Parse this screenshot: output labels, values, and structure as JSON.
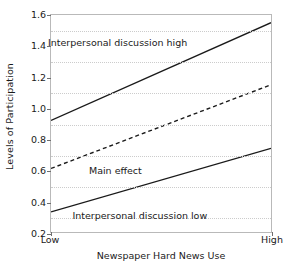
{
  "chart_data": {
    "type": "line",
    "title": "",
    "xlabel": "Newspaper Hard News Use",
    "ylabel": "Levels of Participation",
    "x": [
      0,
      1
    ],
    "xtick_labels": [
      "Low",
      "High"
    ],
    "ylim": [
      0.2,
      1.6
    ],
    "yticks": [
      0.2,
      0.4,
      0.6,
      0.8,
      1.0,
      1.2,
      1.4,
      1.6
    ],
    "ytick_labels": [
      "0.2",
      "0.4",
      "0.6",
      "0.8",
      "1.0",
      "1.2",
      "1.4",
      "1.6"
    ],
    "gridlines": [
      0.3,
      0.5,
      0.7,
      0.9,
      1.1,
      1.3,
      1.5
    ],
    "grid": true,
    "legend_position": "inline-annotations",
    "series": [
      {
        "name": "Interpersonal discussion high",
        "style": "solid",
        "color": "#1a1a1a",
        "values": [
          0.92,
          1.55
        ]
      },
      {
        "name": "Main effect",
        "style": "dashed",
        "color": "#1a1a1a",
        "values": [
          0.61,
          1.15
        ]
      },
      {
        "name": "Interpersonal discussion low",
        "style": "solid",
        "color": "#1a1a1a",
        "values": [
          0.33,
          0.74
        ]
      }
    ],
    "annotations": [
      {
        "text": "Interpersonal discussion high",
        "x": 0.3,
        "y": 1.43
      },
      {
        "text": "Main effect",
        "x": 0.29,
        "y": 0.61
      },
      {
        "text": "Interpersonal discussion low",
        "x": 0.4,
        "y": 0.32
      }
    ]
  }
}
